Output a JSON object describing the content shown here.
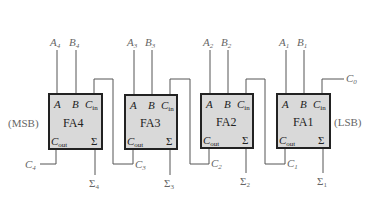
{
  "diagram": {
    "side_labels": {
      "left": "(MSB)",
      "right": "(LSB)"
    },
    "colors": {
      "box_fill": "#d9d9d9",
      "box_stroke": "#222222",
      "wire": "#555555",
      "label": "#666666"
    },
    "adders": [
      {
        "name": "FA4",
        "a": "A",
        "a_sub": "4",
        "b": "B",
        "b_sub": "4",
        "sum": "Σ",
        "sum_sub": "4",
        "carry_out": "C",
        "carry_out_sub": "4"
      },
      {
        "name": "FA3",
        "a": "A",
        "a_sub": "3",
        "b": "B",
        "b_sub": "3",
        "sum": "Σ",
        "sum_sub": "3",
        "carry_out": "C",
        "carry_out_sub": "3"
      },
      {
        "name": "FA2",
        "a": "A",
        "a_sub": "2",
        "b": "B",
        "b_sub": "2",
        "sum": "Σ",
        "sum_sub": "2",
        "carry_out": "C",
        "carry_out_sub": "2"
      },
      {
        "name": "FA1",
        "a": "A",
        "a_sub": "1",
        "b": "B",
        "b_sub": "1",
        "sum": "Σ",
        "sum_sub": "1",
        "carry_out": "C",
        "carry_out_sub": "1"
      }
    ],
    "box_pins": {
      "a": "A",
      "b": "B",
      "cin": "C",
      "cin_sub": "in",
      "cout": "C",
      "cout_sub": "out",
      "sigma": "Σ"
    },
    "carry_in": {
      "label": "C",
      "sub": "0"
    }
  }
}
